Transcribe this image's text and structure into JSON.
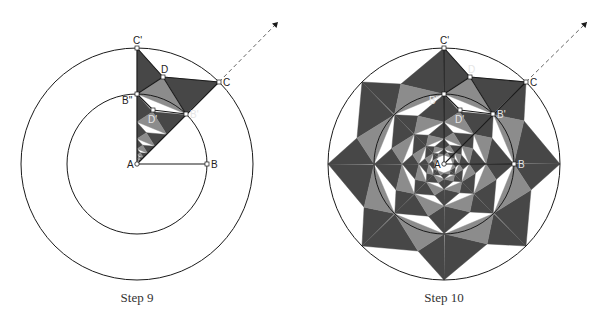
{
  "colors": {
    "dark": "#474747",
    "light": "#8c8c8c",
    "line": "#1a1a1a",
    "label_on_white": "#222222",
    "label_on_fill": "#e6e6e6",
    "dashed": "#666666"
  },
  "geometry": {
    "outer_radius": 116,
    "inner_radius": 70,
    "scale_ratio": 0.6,
    "points_relative_to_A": {
      "C_prime": [
        0,
        -116
      ],
      "C": [
        82,
        -82
      ],
      "D": [
        26,
        -87
      ],
      "B_double_prime": [
        0,
        -70
      ],
      "B_prime": [
        49,
        -50
      ],
      "D_prime": [
        16,
        -54
      ],
      "B": [
        70,
        0
      ]
    }
  },
  "figures": [
    {
      "id": "step9",
      "caption": "Step 9",
      "center_A": [
        137,
        164
      ],
      "arrow_tip": [
        278,
        22
      ],
      "rotations": 1,
      "levels": 7,
      "labels": {
        "A": "A",
        "B": "B",
        "C": "C",
        "C_prime": "C'",
        "D": "D",
        "B_prime": "B'",
        "B_double_prime": "B''",
        "D_prime": "D'"
      }
    },
    {
      "id": "step10",
      "caption": "Step 10",
      "center_A": [
        444,
        164
      ],
      "arrow_tip": [
        587,
        22
      ],
      "rotations": 8,
      "levels": 5,
      "labels": {
        "A": "A",
        "B": "B",
        "C": "C",
        "C_prime": "C'",
        "D": "D",
        "B_prime": "B'",
        "B_double_prime": "B''",
        "D_prime": "D'"
      }
    }
  ]
}
